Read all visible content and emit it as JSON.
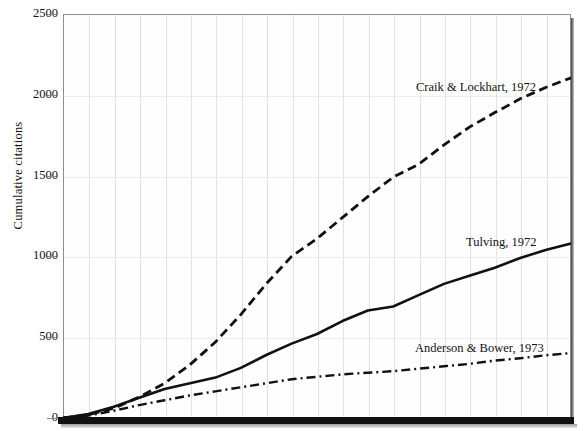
{
  "chart_data": {
    "type": "line",
    "title": "",
    "xlabel": "",
    "ylabel": "Cumulative citations",
    "ylim": [
      0,
      2500
    ],
    "yticks": [
      0,
      500,
      1000,
      1500,
      2000,
      2500
    ],
    "ytick_labels": [
      "0",
      "500",
      "1000",
      "1500",
      "2000",
      "2500"
    ],
    "xlim": [
      0,
      20
    ],
    "xticks": [],
    "xtick_labels": [],
    "grid": "vertical-and-horizontal-light",
    "legend_position": "inline-annotations",
    "series": [
      {
        "name": "Craik & Lockhart, 1972",
        "style": "dashed",
        "color": "#111111",
        "x": [
          0,
          1,
          2,
          3,
          4,
          5,
          6,
          7,
          8,
          9,
          10,
          11,
          12,
          13,
          14,
          15,
          16,
          17,
          18,
          19,
          20
        ],
        "values": [
          0,
          20,
          60,
          130,
          215,
          330,
          470,
          640,
          830,
          1000,
          1110,
          1240,
          1370,
          1490,
          1570,
          1690,
          1800,
          1890,
          1975,
          2045,
          2105
        ]
      },
      {
        "name": "Tulving, 1972",
        "style": "solid",
        "color": "#111111",
        "x": [
          0,
          1,
          2,
          3,
          4,
          5,
          6,
          7,
          8,
          9,
          10,
          11,
          12,
          13,
          14,
          15,
          16,
          17,
          18,
          19,
          20
        ],
        "values": [
          0,
          25,
          70,
          125,
          180,
          215,
          250,
          310,
          390,
          460,
          520,
          600,
          665,
          690,
          760,
          830,
          880,
          930,
          990,
          1040,
          1080
        ]
      },
      {
        "name": "Anderson & Bower, 1973",
        "style": "dash-dot",
        "color": "#111111",
        "x": [
          0,
          1,
          2,
          3,
          4,
          5,
          6,
          7,
          8,
          9,
          10,
          11,
          12,
          13,
          14,
          15,
          16,
          17,
          18,
          19,
          20
        ],
        "values": [
          0,
          15,
          45,
          80,
          110,
          140,
          165,
          190,
          215,
          240,
          255,
          270,
          280,
          290,
          305,
          320,
          335,
          355,
          370,
          388,
          402
        ]
      }
    ],
    "annotations": [
      {
        "text": "Craik & Lockhart, 1972",
        "target_series": "Craik & Lockhart, 1972"
      },
      {
        "text": "Tulving, 1972",
        "target_series": "Tulving, 1972"
      },
      {
        "text": "Anderson & Bower, 1973",
        "target_series": "Anderson & Bower, 1973"
      }
    ]
  },
  "axis": {
    "y_title": "Cumulative citations"
  }
}
